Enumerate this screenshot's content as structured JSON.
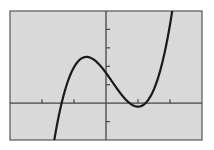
{
  "chart_data": {
    "type": "line",
    "title": "",
    "xlabel": "",
    "ylabel": "",
    "xlim": [
      -3,
      3
    ],
    "ylim": [
      -2,
      5
    ],
    "x_ticks": [
      -2,
      -1,
      1,
      2
    ],
    "y_ticks": [
      -1,
      1,
      2,
      3,
      4
    ],
    "grid": false,
    "legend": null,
    "series": [
      {
        "name": "cubic",
        "description": "cubic polynomial with roots near x=-1.44, 0.63, 1.4; local max ~(-0.75, 2.7); local min ~(1.06, -0.5); y-intercept ~1.6",
        "coefficients_desc": [
          1.3,
          -0.76,
          -2.37,
          1.64
        ],
        "key_points": {
          "roots": [
            -1.44,
            0.63,
            1.4
          ],
          "local_max": [
            -0.75,
            2.7
          ],
          "local_min": [
            1.06,
            -0.5
          ],
          "y_intercept": 1.64
        }
      }
    ]
  },
  "colors": {
    "background": "#d9d9d9",
    "frame": "#555555",
    "axes": "#444444",
    "curve": "#1a1a1a"
  }
}
